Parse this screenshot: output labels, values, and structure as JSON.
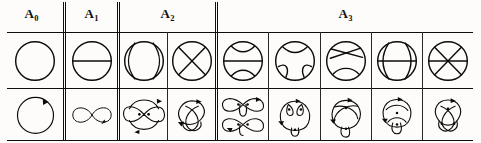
{
  "figure": {
    "type": "chord-diagram-table",
    "rows": 2,
    "row_labels": [
      "chord diagrams",
      "curve diagrams"
    ],
    "columns": [
      {
        "id": "A0",
        "label": "A",
        "subscript": "0",
        "cells": 1
      },
      {
        "id": "A1",
        "label": "A",
        "subscript": "1",
        "cells": 1
      },
      {
        "id": "A2",
        "label": "A",
        "subscript": "2",
        "cells": 2
      },
      {
        "id": "A3",
        "label": "A",
        "subscript": "3",
        "cells": 5
      }
    ],
    "groups": [
      {
        "header": {
          "base": "A",
          "sub": "0",
          "text": "A₀"
        },
        "items": [
          {
            "chords": 0,
            "top": "plain-circle",
            "bottom": "simple-closed-curve"
          }
        ]
      },
      {
        "header": {
          "base": "A",
          "sub": "1",
          "text": "A₁"
        },
        "items": [
          {
            "chords": 1,
            "top": "circle-one-chord",
            "bottom": "figure-eight-curve"
          }
        ]
      },
      {
        "header": {
          "base": "A",
          "sub": "2",
          "text": "A₂"
        },
        "items": [
          {
            "chords": 2,
            "top": "circle-two-parallel-chords",
            "bottom": "two-crossing-curve"
          },
          {
            "chords": 2,
            "top": "circle-two-crossing-chords",
            "bottom": "trefoil-style-curve"
          }
        ]
      },
      {
        "header": {
          "base": "A",
          "sub": "3",
          "text": "A₃"
        },
        "items": [
          {
            "chords": 3,
            "top": "circle-three-chords-a",
            "bottom": "curve-3a"
          },
          {
            "chords": 3,
            "top": "circle-three-chords-b",
            "bottom": "curve-3b"
          },
          {
            "chords": 3,
            "top": "circle-three-chords-c",
            "bottom": "curve-3c"
          },
          {
            "chords": 3,
            "top": "circle-three-chords-d",
            "bottom": "curve-3d"
          },
          {
            "chords": 3,
            "top": "circle-three-chords-e",
            "bottom": "curve-3e"
          }
        ]
      }
    ]
  },
  "colors": {
    "ink": "#0d0b09",
    "rule": "#100e0c",
    "paper": "#fdfcfa"
  }
}
